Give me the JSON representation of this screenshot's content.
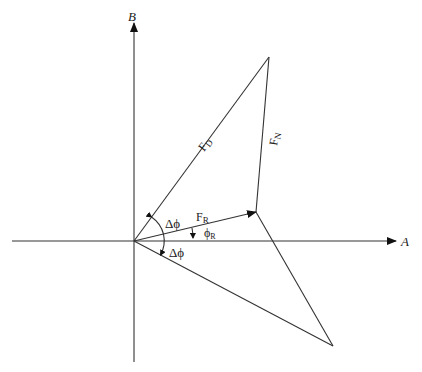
{
  "diagram": {
    "type": "vector-force-diagram",
    "axes": {
      "horizontal_label": "A",
      "vertical_label": "B"
    },
    "vectors": {
      "drag": {
        "label": "F",
        "subscript": "D"
      },
      "normal": {
        "label": "F",
        "subscript": "N"
      },
      "resultant": {
        "label": "F",
        "subscript": "R"
      }
    },
    "angles": {
      "upper_delta": {
        "symbol": "Δϕ"
      },
      "lower_delta": {
        "symbol": "Δϕ"
      },
      "resultant_angle": {
        "label": "ϕ",
        "subscript": "R"
      }
    },
    "colors": {
      "stroke": "#333333",
      "text": "#222222",
      "background": "#ffffff"
    }
  }
}
